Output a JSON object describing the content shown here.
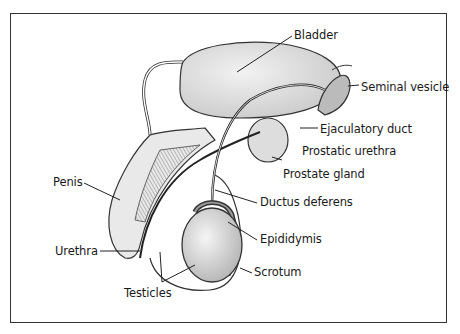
{
  "diagram": {
    "labels": [
      {
        "id": "bladder",
        "text": "Bladder",
        "x": 294,
        "y": 28
      },
      {
        "id": "seminal-vesicle",
        "text": "Seminal vesicle",
        "x": 361,
        "y": 80
      },
      {
        "id": "ejaculatory-duct",
        "text": "Ejaculatory duct",
        "x": 320,
        "y": 123
      },
      {
        "id": "prostatic-urethra",
        "text": "Prostatic urethra",
        "x": 302,
        "y": 145
      },
      {
        "id": "prostate-gland",
        "text": "Prostate gland",
        "x": 283,
        "y": 170
      },
      {
        "id": "penis",
        "text": "Penis",
        "x": 53,
        "y": 176
      },
      {
        "id": "ductus-deferens",
        "text": "Ductus deferens",
        "x": 260,
        "y": 196
      },
      {
        "id": "epididymis",
        "text": "Epididymis",
        "x": 260,
        "y": 233
      },
      {
        "id": "urethra",
        "text": "Urethra",
        "x": 55,
        "y": 244
      },
      {
        "id": "scrotum",
        "text": "Scrotum",
        "x": 254,
        "y": 266
      },
      {
        "id": "testicles",
        "text": "Testicles",
        "x": 124,
        "y": 287
      }
    ]
  }
}
